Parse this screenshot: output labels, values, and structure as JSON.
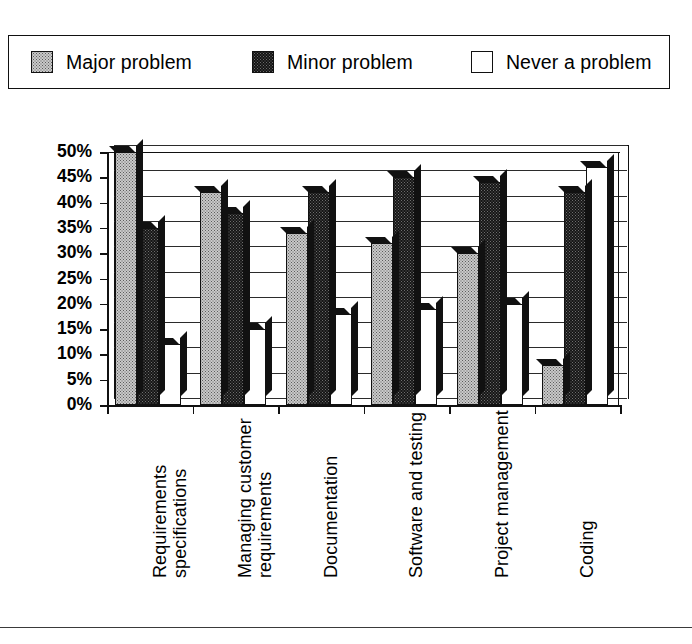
{
  "legend": {
    "entries": [
      {
        "label": "Major problem",
        "swatch": "light-stipple-swatch"
      },
      {
        "label": "Minor problem",
        "swatch": "dark-stipple-swatch"
      },
      {
        "label": "Never a problem",
        "swatch": "empty-white-swatch"
      }
    ]
  },
  "axis": {
    "y_ticks": [
      "50%",
      "45%",
      "40%",
      "35%",
      "30%",
      "25%",
      "20%",
      "15%",
      "10%",
      "5%",
      "0%"
    ]
  },
  "chart_data": {
    "type": "bar",
    "title": "",
    "xlabel": "",
    "ylabel": "",
    "ylim": [
      0,
      50
    ],
    "ytick_step": 5,
    "ytick_format": "percent",
    "grid": true,
    "legend_position": "top",
    "style": "3d-clustered-column",
    "categories": [
      "Requirements specifications",
      "Managing customer requirements",
      "Documentation",
      "Software and testing",
      "Project management",
      "Coding"
    ],
    "series": [
      {
        "name": "Major problem",
        "values": [
          50,
          42,
          34,
          32,
          30,
          8
        ]
      },
      {
        "name": "Minor problem",
        "values": [
          35,
          38,
          42,
          45,
          44,
          42
        ]
      },
      {
        "name": "Never a problem",
        "values": [
          12,
          15,
          18,
          19,
          20,
          47
        ]
      }
    ]
  }
}
